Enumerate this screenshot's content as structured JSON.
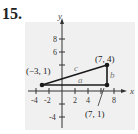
{
  "problem_number": "15.",
  "axes": {
    "x_label": "x",
    "y_label": "y",
    "x_ticks": [
      "-4",
      "-2",
      "2",
      "4",
      "8"
    ],
    "y_ticks": [
      "8",
      "6",
      "-4"
    ]
  },
  "points": [
    {
      "label": "(−3, 1)",
      "x": -3,
      "y": 1
    },
    {
      "label": "(7, 4)",
      "x": 7,
      "y": 4
    },
    {
      "label": "(7, 1)",
      "x": 7,
      "y": 1
    }
  ],
  "sides": {
    "a": "a",
    "b": "b",
    "c": "c"
  },
  "colors": {
    "background_panel": "#f0f0f0",
    "triangle": "#1a1a1a",
    "axes": "#333333",
    "side_labels": "#777777"
  }
}
